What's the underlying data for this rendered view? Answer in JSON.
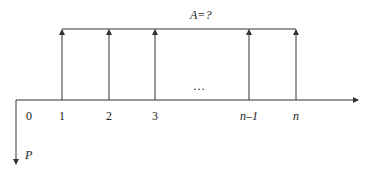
{
  "diagram": {
    "type": "cash-flow-diagram",
    "annuity_label": "A=?",
    "present_value_label": "P",
    "ellipsis": "…",
    "periods": [
      {
        "label": "0",
        "x": 29
      },
      {
        "label": "1",
        "x": 62
      },
      {
        "label": "2",
        "x": 109
      },
      {
        "label": "3",
        "x": 155
      },
      {
        "label": "n–1",
        "x": 249
      },
      {
        "label": "n",
        "x": 296
      }
    ],
    "up_arrows_at_periods": [
      "1",
      "2",
      "3",
      "n–1",
      "n"
    ],
    "down_arrow_at_period": "0",
    "colors": {
      "line": "#333333",
      "text": "#222222",
      "background": "#ffffff"
    }
  }
}
